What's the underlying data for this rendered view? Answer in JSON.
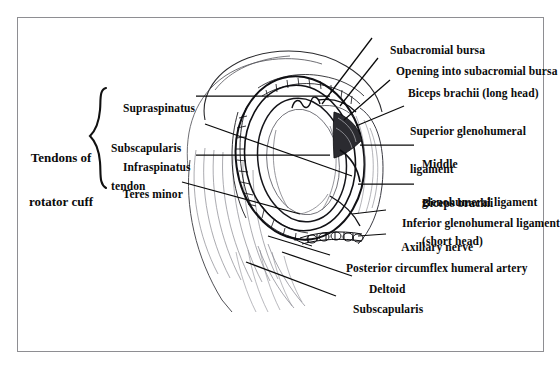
{
  "figure": {
    "view": "lateral view of glenoid cavity with humerus removed",
    "style": "black and white line drawing with leader lines"
  },
  "group_label": {
    "name": "Tendons of rotator cuff",
    "line1": "Tendons of",
    "line2": "rotator cuff",
    "bracket": "curly-brace"
  },
  "left_labels": [
    {
      "id": "supraspinatus",
      "line1": "Supraspinatus",
      "line2": ""
    },
    {
      "id": "subscapularis-tendon",
      "line1": "Subscapularis",
      "line2": "tendon"
    },
    {
      "id": "infraspinatus",
      "line1": "Infraspinatus",
      "line2": ""
    },
    {
      "id": "teres-minor",
      "line1": "Teres minor",
      "line2": ""
    }
  ],
  "right_labels": [
    {
      "id": "subacromial-bursa",
      "line1": "Subacromial bursa",
      "line2": ""
    },
    {
      "id": "opening-into-subacromial-bursa",
      "line1": "Opening into subacromial bursa",
      "line2": ""
    },
    {
      "id": "biceps-brachii-long-head",
      "line1": "Biceps brachii (long head)",
      "line2": ""
    },
    {
      "id": "superior-glenohumeral-ligament",
      "line1": "Superior glenohumeral",
      "line2": "ligament"
    },
    {
      "id": "middle-glenohumeral-ligament",
      "line1": "Middle",
      "line2": "glenohumeral ligament"
    },
    {
      "id": "biceps-brachii-short-head",
      "line1": "Biceps brachii",
      "line2": "(short head)"
    },
    {
      "id": "inferior-glenohumeral-ligament",
      "line1": "Inferior glenohumeral ligament",
      "line2": ""
    },
    {
      "id": "axillary-nerve",
      "line1": "Axillary nerve",
      "line2": ""
    },
    {
      "id": "posterior-circumflex-humeral-artery",
      "line1": "Posterior circumflex humeral artery",
      "line2": ""
    },
    {
      "id": "deltoid",
      "line1": "Deltoid",
      "line2": ""
    },
    {
      "id": "subscapularis",
      "line1": "Subscapularis",
      "line2": ""
    }
  ],
  "colors": {
    "ink": "#0a0a0a",
    "frame": "#8e8e92",
    "page": "#ffffff",
    "shading": "#3a3a3a",
    "light_stroke": "#6e6e74"
  }
}
